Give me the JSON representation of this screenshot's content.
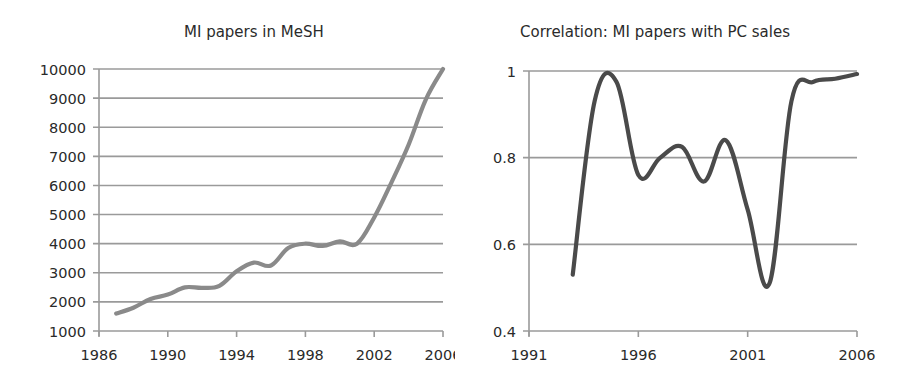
{
  "chart_data": [
    {
      "type": "line",
      "title": "MI papers in MeSH",
      "xlabel": "",
      "ylabel": "",
      "x": [
        1987,
        1988,
        1989,
        1990,
        1991,
        1992,
        1993,
        1994,
        1995,
        1996,
        1997,
        1998,
        1999,
        2000,
        2001,
        2002,
        2003,
        2004,
        2005,
        2006
      ],
      "series": [
        {
          "name": "MI papers",
          "values": [
            1600,
            1800,
            2100,
            2250,
            2500,
            2480,
            2550,
            3050,
            3350,
            3250,
            3850,
            4000,
            3920,
            4080,
            4000,
            4900,
            6100,
            7400,
            8950,
            10000
          ],
          "color": "#8a8a8a"
        }
      ],
      "xlim": [
        1986,
        2006
      ],
      "ylim": [
        1000,
        10000
      ],
      "xticks": [
        "1986",
        "1990",
        "1994",
        "1998",
        "2002",
        "2006"
      ],
      "yticks": [
        "1000",
        "2000",
        "3000",
        "4000",
        "5000",
        "6000",
        "7000",
        "8000",
        "9000",
        "10000"
      ],
      "grid": "horizontal",
      "legend": "none",
      "smooth": true
    },
    {
      "type": "line",
      "title": "Correlation: MI papers with PC sales",
      "xlabel": "",
      "ylabel": "",
      "x": [
        1993,
        1994,
        1995,
        1996,
        1997,
        1998,
        1999,
        2000,
        2001,
        2002,
        2003,
        2004,
        2005,
        2006
      ],
      "series": [
        {
          "name": "Correlation",
          "values": [
            0.53,
            0.93,
            0.975,
            0.76,
            0.8,
            0.825,
            0.745,
            0.84,
            0.68,
            0.51,
            0.93,
            0.975,
            0.982,
            0.993
          ],
          "color": "#4a4a4a"
        }
      ],
      "xlim": [
        1991,
        2006
      ],
      "ylim": [
        0.4,
        1.0
      ],
      "xticks": [
        "1991",
        "1996",
        "2001",
        "2006"
      ],
      "yticks": [
        "0.4",
        "0.6",
        "0.8",
        "1"
      ],
      "grid": "horizontal",
      "legend": "none",
      "smooth": true
    }
  ]
}
